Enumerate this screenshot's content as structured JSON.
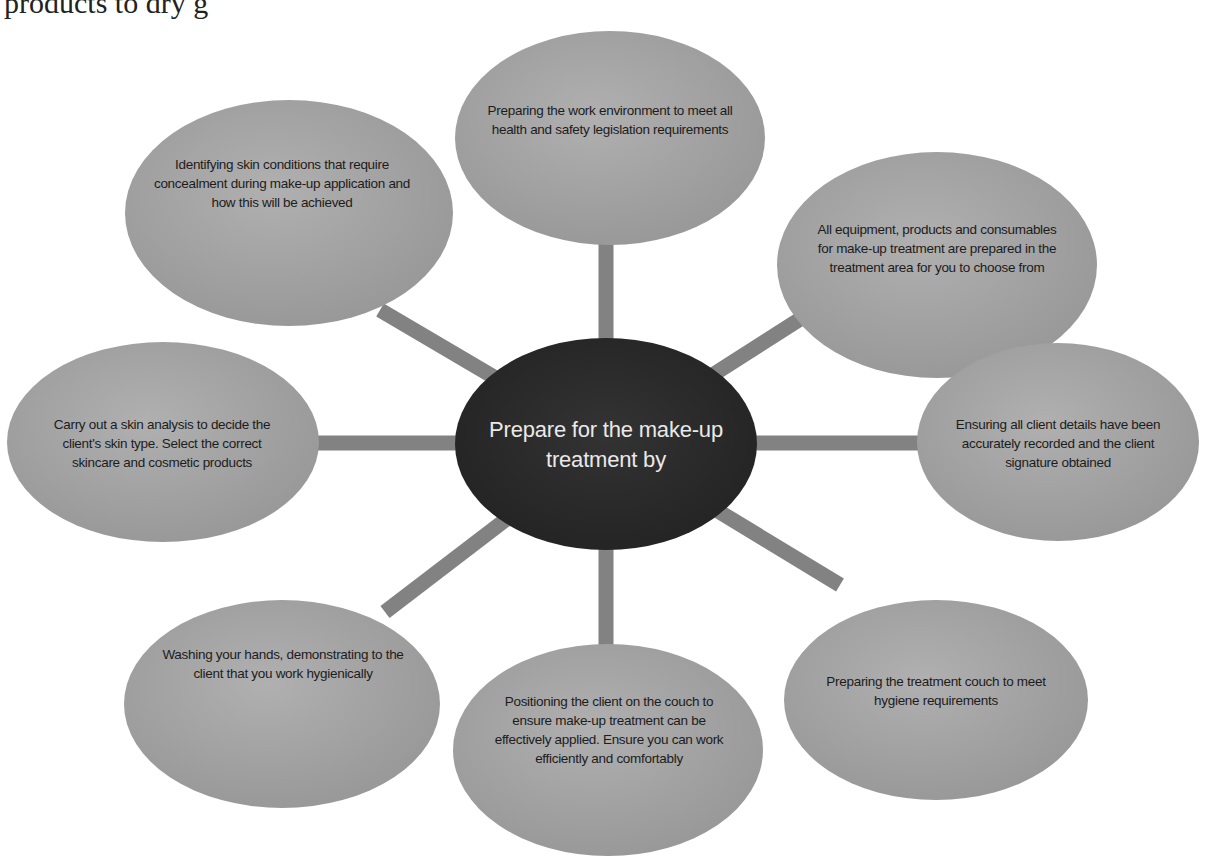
{
  "page_fragment": "products to dry g",
  "diagram": {
    "center": {
      "label": "Prepare for the make-up treatment by",
      "fill": "#2b2b2b",
      "text_color": "#e9e9e9"
    },
    "spoke_color": "#808080",
    "node_fill": "#a2a2a2",
    "nodes": [
      {
        "position": "top",
        "label": "Preparing the work environment to meet all health and safety legislation requirements"
      },
      {
        "position": "top-right",
        "label": "All equipment, products and consumables for make-up treatment are prepared in the treatment area for you to choose from"
      },
      {
        "position": "right",
        "label": "Ensuring all client details have been accurately recorded and the client signature obtained"
      },
      {
        "position": "bottom-right",
        "label": "Preparing the treatment couch to meet hygiene requirements"
      },
      {
        "position": "bottom",
        "label": "Positioning the client on the couch to ensure make-up treatment can be effectively applied. Ensure you can work efficiently and comfortably"
      },
      {
        "position": "bottom-left",
        "label": "Washing your hands, demonstrating to the client that you work hygienically"
      },
      {
        "position": "left",
        "label": "Carry out a skin analysis to decide the client's skin type. Select the correct skincare and cosmetic products"
      },
      {
        "position": "top-left",
        "label": "Identifying skin conditions that require concealment during make-up application and how this will be achieved"
      }
    ]
  }
}
